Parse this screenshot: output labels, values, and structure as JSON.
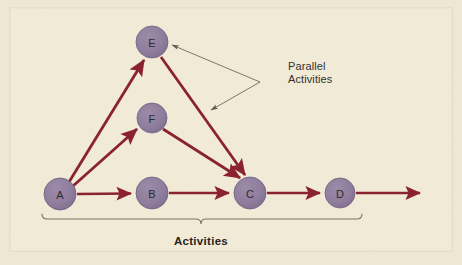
{
  "figure": {
    "kind": "network-diagram",
    "background_color": "#f2ecd8",
    "outer_margin_color": "#eee7d2",
    "border_color": "#ded6be",
    "node_fill": "#8f7d9d",
    "node_stroke": "#6f5f7d",
    "node_text_color": "#2b2b2b",
    "arrow_color": "#8b2230",
    "callout_line_color": "#6f6a5e",
    "bracket_color": "#7a7264"
  },
  "nodes": [
    {
      "id": "A",
      "label": "A",
      "cx": 60,
      "cy": 194,
      "r": 16
    },
    {
      "id": "B",
      "label": "B",
      "cx": 152,
      "cy": 193,
      "r": 16
    },
    {
      "id": "C",
      "label": "C",
      "cx": 250,
      "cy": 193,
      "r": 16
    },
    {
      "id": "D",
      "label": "D",
      "cx": 340,
      "cy": 193,
      "r": 15
    },
    {
      "id": "E",
      "label": "E",
      "cx": 152,
      "cy": 42,
      "r": 16
    },
    {
      "id": "F",
      "label": "F",
      "cx": 152,
      "cy": 118,
      "r": 15
    }
  ],
  "edges": [
    {
      "from": "A",
      "to": "B",
      "kind": "activity-arrow"
    },
    {
      "from": "B",
      "to": "C",
      "kind": "activity-arrow"
    },
    {
      "from": "C",
      "to": "D",
      "kind": "activity-arrow"
    },
    {
      "from": "D",
      "to": "open-end",
      "kind": "activity-arrow"
    },
    {
      "from": "A",
      "to": "E",
      "kind": "parallel-arrow"
    },
    {
      "from": "A",
      "to": "F",
      "kind": "parallel-arrow"
    },
    {
      "from": "E",
      "to": "C",
      "kind": "parallel-arrow"
    },
    {
      "from": "F",
      "to": "C",
      "kind": "parallel-arrow"
    }
  ],
  "callout": {
    "line1": "Parallel",
    "line2": "Activities",
    "text_x": 288,
    "text_y": 70,
    "elbow_x": 260,
    "elbow_y": 82,
    "target_upper": {
      "x": 172,
      "y": 45
    },
    "target_lower": {
      "x": 211,
      "y": 110
    }
  },
  "bracket": {
    "label": "Activities",
    "x_start": 42,
    "x_end": 362,
    "y": 219,
    "tick_x": 201,
    "label_x": 201,
    "label_y": 245
  }
}
